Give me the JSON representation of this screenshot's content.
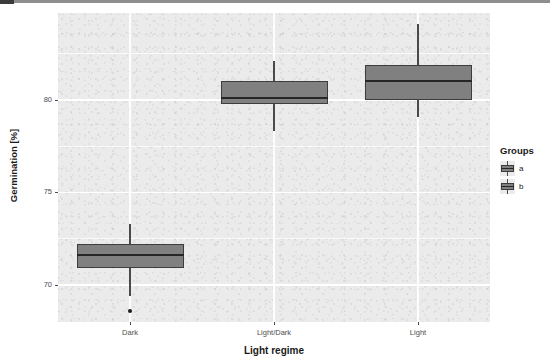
{
  "chart_data": {
    "type": "box",
    "title": "",
    "xlabel": "Light regime",
    "ylabel": "Germination [%]",
    "categories": [
      "Dark",
      "Light/Dark",
      "Light"
    ],
    "ylim": [
      68.0,
      84.7
    ],
    "y_ticks": [
      70,
      75,
      80
    ],
    "y_tick_labels": [
      "70",
      "75",
      "80"
    ],
    "grid": true,
    "grid_color": "#ffffff",
    "panel_background": "#ebebeb",
    "box_fill": "#808080",
    "box_outline": "#3d3d3d",
    "median_color": "#262626",
    "legend": {
      "title": "Groups",
      "position": "right",
      "entries": [
        {
          "label": "a",
          "fill": "#808080"
        },
        {
          "label": "b",
          "fill": "#808080"
        }
      ]
    },
    "boxes": [
      {
        "category": "Dark",
        "group": "a",
        "whisker_low": 69.4,
        "q1": 70.9,
        "median": 71.6,
        "q3": 72.2,
        "whisker_high": 73.3,
        "outliers": [
          68.6
        ]
      },
      {
        "category": "Light/Dark",
        "group": "b",
        "whisker_low": 78.3,
        "q1": 79.8,
        "median": 80.1,
        "q3": 81.0,
        "whisker_high": 82.1,
        "outliers": []
      },
      {
        "category": "Light",
        "group": "b",
        "whisker_low": 79.1,
        "q1": 80.0,
        "median": 81.0,
        "q3": 81.9,
        "whisker_high": 84.1,
        "outliers": []
      }
    ]
  }
}
